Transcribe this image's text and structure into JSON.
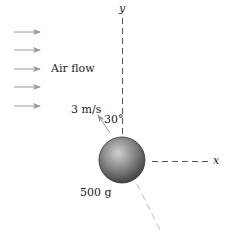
{
  "diagram": {
    "labels": {
      "y_axis": "y",
      "x_axis": "x",
      "air_flow": "Air flow",
      "velocity": "3 m/s",
      "angle": "30°",
      "mass": "500 g"
    },
    "air_flow_arrow_count": 5,
    "colors": {
      "text": "#222222",
      "axis_dash": "#555555",
      "arrow": "#9a9a9a",
      "trajectory": "#cfcfcf",
      "sphere_light": "#c8c8c8",
      "sphere_mid": "#8a8a8a",
      "sphere_dark": "#3a3a3a"
    }
  }
}
